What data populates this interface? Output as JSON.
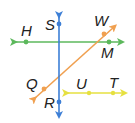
{
  "diagram": {
    "lines": [
      {
        "id": "line-SR",
        "color": "#3d7fd6",
        "points": [
          "S",
          "R"
        ],
        "x1": 59,
        "y1": 12,
        "x2": 59,
        "y2": 118
      },
      {
        "id": "line-HM",
        "color": "#5cb85c",
        "points": [
          "H",
          "M"
        ],
        "x1": 10,
        "y1": 42,
        "x2": 125,
        "y2": 42
      },
      {
        "id": "line-WQ",
        "color": "#f0a050",
        "points": [
          "W",
          "Q"
        ],
        "x1": 117,
        "y1": 24,
        "x2": 31,
        "y2": 102
      },
      {
        "id": "line-UT",
        "color": "#e6e040",
        "points": [
          "U",
          "T"
        ],
        "x1": 63,
        "y1": 93,
        "x2": 127,
        "y2": 93
      }
    ],
    "points": [
      {
        "name": "S",
        "x": 59,
        "y": 24,
        "label_x": 45,
        "label_y": 30,
        "color": "#3d7fd6"
      },
      {
        "name": "R",
        "x": 59,
        "y": 102,
        "label_x": 44,
        "label_y": 107,
        "color": "#3d7fd6"
      },
      {
        "name": "H",
        "x": 26,
        "y": 42,
        "label_x": 21,
        "label_y": 36,
        "color": "#5cb85c"
      },
      {
        "name": "M",
        "x": 109,
        "y": 42,
        "label_x": 101,
        "label_y": 58,
        "color": "#5cb85c"
      },
      {
        "name": "W",
        "x": 104,
        "y": 34,
        "label_x": 95,
        "label_y": 25,
        "color": "#f0a050"
      },
      {
        "name": "Q",
        "x": 44,
        "y": 89,
        "label_x": 26,
        "label_y": 89,
        "color": "#f0a050"
      },
      {
        "name": "U",
        "x": 89,
        "y": 93,
        "label_x": 76,
        "label_y": 89,
        "color": "#e6e040"
      },
      {
        "name": "T",
        "x": 113,
        "y": 93,
        "label_x": 109,
        "label_y": 88,
        "color": "#e6e040"
      }
    ],
    "labels": {
      "S": "S",
      "R": "R",
      "H": "H",
      "M": "M",
      "W": "W",
      "Q": "Q",
      "U": "U",
      "T": "T"
    }
  }
}
